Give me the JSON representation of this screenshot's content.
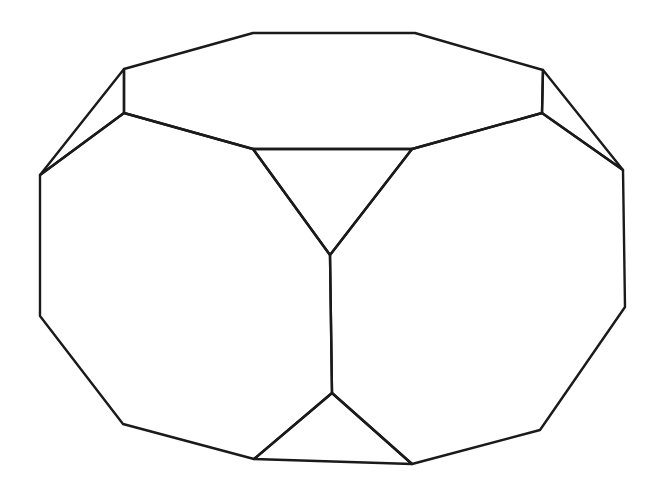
{
  "figure": {
    "stroke_color": "#1a1a1a",
    "background": "#ffffff"
  },
  "vertices": {
    "A": [
      253,
      33
    ],
    "B": [
      415,
      33
    ],
    "C": [
      543,
      70
    ],
    "D": [
      542,
      113
    ],
    "E": [
      412,
      149
    ],
    "F": [
      253,
      149
    ],
    "G": [
      124,
      113
    ],
    "H": [
      124,
      69
    ],
    "I": [
      40,
      175
    ],
    "J": [
      623,
      170
    ],
    "K": [
      330,
      255
    ],
    "L": [
      332,
      393
    ],
    "M": [
      40,
      316
    ],
    "N": [
      123,
      424
    ],
    "O": [
      254,
      459
    ],
    "P": [
      412,
      464
    ],
    "Q": [
      540,
      430
    ],
    "R": [
      625,
      307
    ]
  }
}
